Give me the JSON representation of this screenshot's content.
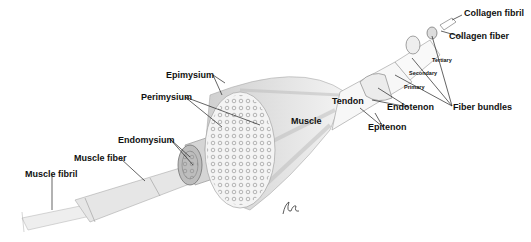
{
  "diagram": {
    "labels": {
      "collagen_fibril": "Collagen fibril",
      "collagen_fiber": "Collagen fiber",
      "tertiary": "Tertiary",
      "secondary": "Secondary",
      "primary": "Primary",
      "fiber_bundles": "Fiber bundles",
      "endotenon": "Endotenon",
      "tendon": "Tendon",
      "epitenon": "Epitenon",
      "muscle": "Muscle",
      "epimysium": "Epimysium",
      "perimysium": "Perimysium",
      "endomysium": "Endomysium",
      "muscle_fiber": "Muscle fiber",
      "muscle_fibril": "Muscle fibril"
    },
    "signature": "signature-mark",
    "colors": {
      "background": "#ffffff",
      "ink": "#111111",
      "shading": "#b8b8b8"
    }
  }
}
